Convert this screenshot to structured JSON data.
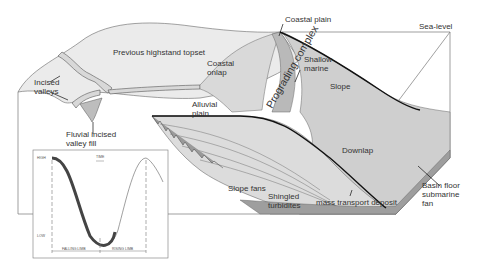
{
  "diagram": {
    "labels": {
      "sea_level": "Sea-level",
      "coastal_plain": "Coastal plain",
      "previous_highstand_topset": "Previous highstand topset",
      "coastal_onlap": "Coastal onlap",
      "shallow_marine": "Shallow marine",
      "slope": "Slope",
      "incised_valleys": "Incised valleys",
      "alluvial_plain": "Alluvial plain",
      "prograding_complex": "Prograding complex",
      "fluvial_incised_valley_fill": "Fluvial incised valley fill",
      "downlap": "Downlap",
      "slope_fans": "Slope fans",
      "shingled_turbidites": "Shingled turbidites",
      "basin_floor_submarine_fan": "Basin floor submarine fan",
      "mass_transport_deposit": "mass transport deposit"
    },
    "colors": {
      "fill_light": "#e6e6e6",
      "fill_mid": "#cfcfcf",
      "fill_dark": "#a8a8a8",
      "line": "#555555",
      "bold_line": "#111111"
    }
  },
  "inset": {
    "y_high": "HIGH",
    "y_low": "LOW",
    "time_label": "TIME",
    "falling_limb": "FALLING LIMB",
    "rising_limb": "RISING LIMB"
  }
}
